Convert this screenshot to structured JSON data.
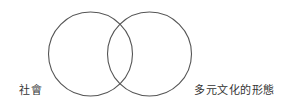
{
  "diagram": {
    "type": "venn",
    "stroke_color": "#555555",
    "background": "#ffffff",
    "circles": [
      {
        "id": "society",
        "label": "社會",
        "cx": 90.5,
        "cy": 54,
        "r": 42
      },
      {
        "id": "multicultural-forms",
        "label": "多元文化的形態",
        "cx": 149.5,
        "cy": 54,
        "r": 42
      }
    ]
  }
}
